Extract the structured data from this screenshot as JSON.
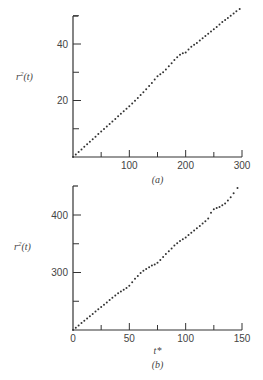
{
  "chart_data": [
    {
      "type": "scatter",
      "panel_label": "(a)",
      "title": "",
      "xlabel": "",
      "ylabel": "r²(t)",
      "ylabel_base": "r",
      "ylabel_sup": "2",
      "ylabel_rest": "(t)",
      "xlim": [
        0,
        300
      ],
      "ylim": [
        0,
        55
      ],
      "x_ticks": [
        0,
        50,
        100,
        150,
        200,
        250,
        300
      ],
      "x_tick_labels": [
        "",
        "",
        "100",
        "",
        "200",
        "",
        "300"
      ],
      "y_ticks": [
        0,
        10,
        20,
        30,
        40,
        50
      ],
      "y_tick_labels": [
        "",
        "",
        "20",
        "",
        "40",
        ""
      ],
      "grid": false,
      "x": [
        0,
        5,
        10,
        15,
        20,
        25,
        30,
        35,
        40,
        45,
        50,
        55,
        60,
        65,
        70,
        75,
        80,
        85,
        90,
        95,
        100,
        105,
        110,
        115,
        120,
        125,
        130,
        135,
        140,
        145,
        150,
        155,
        160,
        165,
        170,
        175,
        180,
        185,
        190,
        195,
        200,
        205,
        210,
        215,
        220,
        225,
        230,
        235,
        240,
        245,
        250,
        255,
        260,
        265,
        270,
        275,
        280,
        285,
        290,
        296
      ],
      "y": [
        0,
        0.9,
        1.8,
        2.7,
        3.6,
        4.5,
        5.4,
        6.3,
        7.2,
        8.1,
        9.0,
        9.9,
        10.8,
        11.7,
        12.6,
        13.5,
        14.4,
        15.3,
        16.2,
        17.1,
        18.0,
        18.9,
        19.9,
        20.9,
        21.9,
        22.9,
        24.0,
        25.1,
        26.2,
        27.4,
        28.6,
        29.3,
        30.0,
        31.0,
        32.1,
        33.2,
        34.3,
        35.3,
        36.2,
        36.7,
        37.0,
        38.0,
        39.0,
        39.7,
        40.4,
        41.2,
        42.0,
        42.8,
        43.6,
        44.4,
        45.2,
        46.0,
        46.9,
        47.8,
        48.5,
        49.2,
        50.0,
        50.8,
        51.6,
        52.4
      ]
    },
    {
      "type": "scatter",
      "panel_label": "(b)",
      "title": "",
      "xlabel": "t*",
      "ylabel": "r²(t)",
      "ylabel_base": "r",
      "ylabel_sup": "2",
      "ylabel_rest": "(t)",
      "xlim": [
        0,
        150
      ],
      "ylim": [
        200,
        450
      ],
      "x_ticks": [
        0,
        25,
        50,
        75,
        100,
        125,
        150
      ],
      "x_tick_labels": [
        "0",
        "",
        "50",
        "",
        "100",
        "",
        "150"
      ],
      "y_ticks": [
        200,
        250,
        300,
        350,
        400
      ],
      "y_tick_labels": [
        "",
        "",
        "300",
        "",
        "400"
      ],
      "grid": false,
      "x": [
        0,
        2.5,
        5,
        7.5,
        10,
        12.5,
        15,
        17.5,
        20,
        22.5,
        25,
        27.5,
        30,
        32.5,
        35,
        37.5,
        40,
        42.5,
        45,
        47.5,
        50,
        52.5,
        55,
        57.5,
        60,
        62.5,
        65,
        67.5,
        70,
        72.5,
        75,
        77.5,
        80,
        82.5,
        85,
        87.5,
        90,
        92.5,
        95,
        97.5,
        100,
        102.5,
        105,
        107.5,
        110,
        112.5,
        115,
        117.5,
        120,
        122.5,
        125,
        127.5,
        130,
        132.5,
        135,
        137.5,
        140,
        142.5,
        146
      ],
      "y": [
        200,
        204,
        208,
        212,
        216,
        220,
        224,
        228,
        232,
        236,
        240,
        244,
        248,
        252,
        256,
        260,
        264,
        267,
        270,
        273,
        277,
        283,
        289,
        294,
        299,
        303,
        306,
        309,
        312,
        314,
        317,
        322,
        327,
        332,
        337,
        342,
        347,
        351,
        355,
        358,
        361,
        365,
        369,
        373,
        377,
        381,
        385,
        389,
        394,
        404,
        410,
        412,
        414,
        417,
        420,
        425,
        431,
        438,
        447
      ]
    }
  ]
}
